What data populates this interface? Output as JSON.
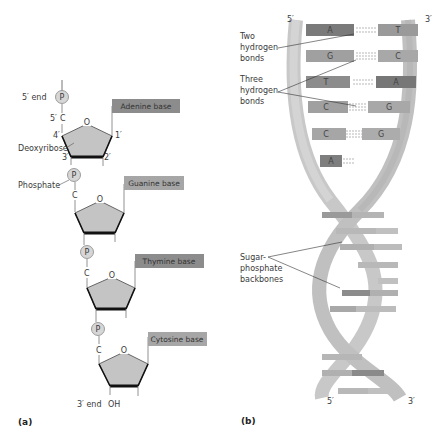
{
  "panel_a": {
    "label": "(a)",
    "five_prime_end": "5′ end",
    "three_prime_end": "3′ end",
    "oh": "OH",
    "phosphate_label": "Phosphate",
    "deoxyribose_label": "Deoxyribose",
    "carbon_labels": {
      "c5": "5′",
      "c4": "4′",
      "c3": "3′",
      "c2": "2′",
      "c1": "1′"
    },
    "carbon": "C",
    "oxygen": "O",
    "phosphate_symbol": "P",
    "nucleotides": [
      {
        "base": "Adenine base"
      },
      {
        "base": "Guanine base"
      },
      {
        "base": "Thymine base"
      },
      {
        "base": "Cytosine base"
      }
    ]
  },
  "panel_b": {
    "label": "(b)",
    "top_left": "5′",
    "top_right": "3′",
    "bottom_left": "5′",
    "bottom_right": "3′",
    "two_hbonds_label": [
      "Two",
      "hydrogen",
      "bonds"
    ],
    "three_hbonds_label": [
      "Three",
      "hydrogen",
      "bonds"
    ],
    "backbone_label": [
      "Sugar-",
      "phosphate",
      "backbones"
    ],
    "base_pairs": [
      {
        "left": "A",
        "right": "T"
      },
      {
        "left": "G",
        "right": "C"
      },
      {
        "left": "T",
        "right": "A"
      },
      {
        "left": "C",
        "right": "G"
      },
      {
        "left": "C",
        "right": "G"
      },
      {
        "left": "A",
        "right": ""
      }
    ]
  },
  "colors": {
    "sugar_fill": "#c4c4c4",
    "base_box": "#8c8c8c",
    "base_box_light": "#a6a6a6",
    "base_box_dark": "#7a7a7a",
    "backbone": "#c8c8c8",
    "phosphate_fill": "#d6d6d6"
  }
}
